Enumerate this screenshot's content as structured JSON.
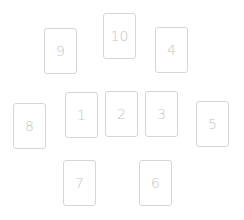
{
  "spread": {
    "cards": [
      {
        "position": "1",
        "label": "1",
        "x": 65,
        "y": 92
      },
      {
        "position": "2",
        "label": "2",
        "x": 105,
        "y": 91
      },
      {
        "position": "3",
        "label": "3",
        "x": 145,
        "y": 91
      },
      {
        "position": "4",
        "label": "4",
        "x": 155,
        "y": 27
      },
      {
        "position": "5",
        "label": "5",
        "x": 196,
        "y": 101
      },
      {
        "position": "6",
        "label": "6",
        "x": 139,
        "y": 160
      },
      {
        "position": "7",
        "label": "7",
        "x": 63,
        "y": 160
      },
      {
        "position": "8",
        "label": "8",
        "x": 13,
        "y": 103
      },
      {
        "position": "9",
        "label": "9",
        "x": 44,
        "y": 28
      },
      {
        "position": "10",
        "label": "10",
        "x": 103,
        "y": 13
      }
    ],
    "colors": {
      "border": "#d6d6d6",
      "text": "#c4c4c4",
      "background": "#ffffff"
    }
  }
}
